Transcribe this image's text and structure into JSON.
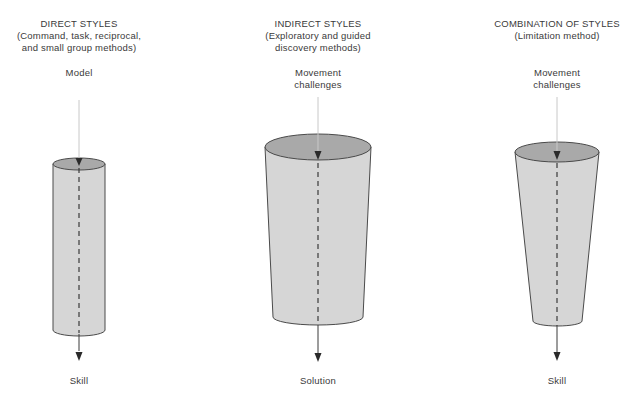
{
  "columns": [
    {
      "title": "DIRECT STYLES",
      "subtitle_lines": [
        "(Command, task, reciprocal,",
        "and small group methods)"
      ],
      "input_lines": [
        "Model"
      ],
      "output": "Skill",
      "shape": "cylinder"
    },
    {
      "title": "INDIRECT STYLES",
      "subtitle_lines": [
        "(Exploratory and guided",
        "discovery methods)"
      ],
      "input_lines": [
        "Movement",
        "challenges"
      ],
      "output": "Solution",
      "shape": "wide-tapered-cylinder"
    },
    {
      "title": "COMBINATION OF STYLES",
      "subtitle_lines": [
        "(Limitation method)"
      ],
      "input_lines": [
        "Movement",
        "challenges"
      ],
      "output": "Skill",
      "shape": "narrow-tapered-cylinder"
    }
  ],
  "colors": {
    "body_fill": "#d6d6d6",
    "top_fill": "#a9a9a9",
    "outline": "#4a4a4a",
    "arrow": "#2a2a2a",
    "text": "#3a3a3a"
  }
}
